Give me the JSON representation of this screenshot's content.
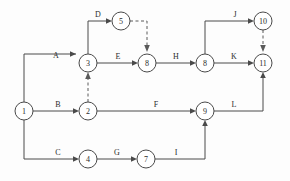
{
  "diagram": {
    "type": "network-diagram",
    "colors": {
      "line": "#4a4a4a",
      "dummy_line": "#5a5a5a",
      "node_fill": "#ffffff",
      "label_text": "#2b2b2b",
      "background": "#fdfdfd"
    },
    "nodes": [
      {
        "id": "n1",
        "label": "1",
        "cx": 24,
        "cy": 111,
        "r": 9
      },
      {
        "id": "n2",
        "label": "2",
        "cx": 88,
        "cy": 111,
        "r": 9
      },
      {
        "id": "n3",
        "label": "3",
        "cx": 88,
        "cy": 63,
        "r": 9
      },
      {
        "id": "n4",
        "label": "4",
        "cx": 88,
        "cy": 159,
        "r": 9
      },
      {
        "id": "n5",
        "label": "5",
        "cx": 121,
        "cy": 21,
        "r": 9
      },
      {
        "id": "n7",
        "label": "7",
        "cx": 146,
        "cy": 159,
        "r": 9
      },
      {
        "id": "n8a",
        "label": "8",
        "cx": 147,
        "cy": 63,
        "r": 9
      },
      {
        "id": "n8b",
        "label": "8",
        "cx": 205,
        "cy": 63,
        "r": 9
      },
      {
        "id": "n9",
        "label": "9",
        "cx": 205,
        "cy": 111,
        "r": 9
      },
      {
        "id": "n10",
        "label": "10",
        "cx": 263,
        "cy": 21,
        "r": 9
      },
      {
        "id": "n11",
        "label": "11",
        "cx": 263,
        "cy": 63,
        "r": 9
      }
    ],
    "edges": [
      {
        "id": "eA",
        "label": "A",
        "from": "n1",
        "to": "n3",
        "style": "solid",
        "label_x": 56,
        "label_y": 58
      },
      {
        "id": "eB",
        "label": "B",
        "from": "n1",
        "to": "n2",
        "style": "solid",
        "label_x": 58,
        "label_y": 107
      },
      {
        "id": "eC",
        "label": "C",
        "from": "n1",
        "to": "n4",
        "style": "solid",
        "label_x": 58,
        "label_y": 155
      },
      {
        "id": "eD",
        "label": "D",
        "from": "n3",
        "to": "n5",
        "style": "solid",
        "label_x": 98,
        "label_y": 17
      },
      {
        "id": "eE",
        "label": "E",
        "from": "n3",
        "to": "n8a",
        "style": "solid",
        "label_x": 118,
        "label_y": 59
      },
      {
        "id": "eF",
        "label": "F",
        "from": "n2",
        "to": "n9",
        "style": "solid",
        "label_x": 156,
        "label_y": 107
      },
      {
        "id": "eG",
        "label": "G",
        "from": "n4",
        "to": "n7",
        "style": "solid",
        "label_x": 117,
        "label_y": 155
      },
      {
        "id": "eH",
        "label": "H",
        "from": "n8a",
        "to": "n8b",
        "style": "solid",
        "label_x": 176,
        "label_y": 59
      },
      {
        "id": "eI",
        "label": "I",
        "from": "n7",
        "to": "n9",
        "style": "solid",
        "label_x": 176,
        "label_y": 155
      },
      {
        "id": "eJ",
        "label": "J",
        "from": "n8b",
        "to": "n10",
        "style": "solid",
        "label_x": 235,
        "label_y": 17
      },
      {
        "id": "eK",
        "label": "K",
        "from": "n8b",
        "to": "n11",
        "style": "solid",
        "label_x": 234,
        "label_y": 59
      },
      {
        "id": "eL",
        "label": "L",
        "from": "n9",
        "to": "n11",
        "style": "solid",
        "label_x": 234,
        "label_y": 107
      },
      {
        "id": "dummy1",
        "label": "",
        "from": "n5",
        "to": "n8a",
        "style": "dashed",
        "label_x": 0,
        "label_y": 0
      },
      {
        "id": "dummy2",
        "label": "",
        "from": "n2",
        "to": "n3",
        "style": "dashed",
        "label_x": 0,
        "label_y": 0
      },
      {
        "id": "dummy3",
        "label": "",
        "from": "n10",
        "to": "n11",
        "style": "dashed",
        "label_x": 0,
        "label_y": 0
      }
    ]
  }
}
